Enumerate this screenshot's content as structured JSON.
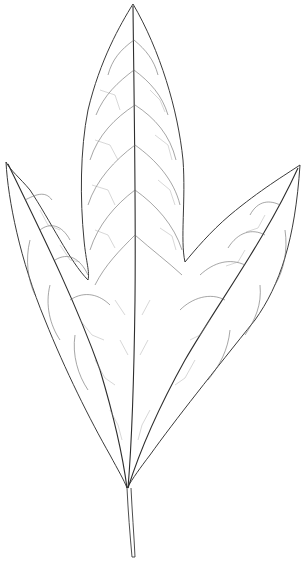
{
  "image": {
    "subject": "three-lobed leaf line drawing",
    "background_color": "#ffffff",
    "line_color": "#3a3a3a",
    "lobes": [
      "left",
      "center",
      "right"
    ]
  }
}
